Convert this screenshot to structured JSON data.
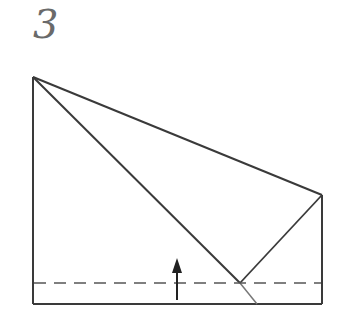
{
  "step": {
    "number": "3"
  },
  "diagram": {
    "colors": {
      "line": "#3a3a3a",
      "fold_line": "#555555",
      "background": "#ffffff"
    },
    "outline": "33,77 322,195 322,304 33,304",
    "diagonal": {
      "x1": 33,
      "y1": 77,
      "x2": 257,
      "y2": 304
    },
    "right_flap": {
      "x1": 322,
      "y1": 195,
      "x2": 240,
      "y2": 283
    },
    "valley_fold_line": {
      "x1": 33,
      "y1": 283,
      "x2": 322,
      "y2": 283
    },
    "fold_arrow": {
      "x": 177,
      "y_start": 300,
      "y_end": 258,
      "direction": "up"
    }
  }
}
